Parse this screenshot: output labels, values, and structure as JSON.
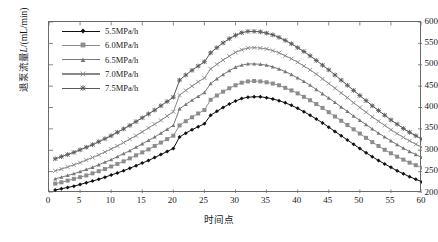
{
  "chart_data": {
    "type": "line",
    "title": "",
    "xlabel": "时间点",
    "ylabel_prefix": "退泵流量",
    "ylabel_italic": "L",
    "ylabel_suffix": "/(mL/min)",
    "ylabel_full": "退泵流量L/(mL/min)",
    "xlim": [
      0,
      60
    ],
    "ylim": [
      200,
      600
    ],
    "xticks": [
      0,
      5,
      10,
      15,
      20,
      25,
      30,
      35,
      40,
      45,
      50,
      55,
      60
    ],
    "yticks": [
      200,
      250,
      300,
      350,
      400,
      450,
      500,
      550,
      600
    ],
    "grid": false,
    "legend_position": "upper-left-inside",
    "x": [
      1,
      2,
      3,
      4,
      5,
      6,
      7,
      8,
      9,
      10,
      11,
      12,
      13,
      14,
      15,
      16,
      17,
      18,
      19,
      20,
      21,
      22,
      23,
      24,
      25,
      26,
      27,
      28,
      29,
      30,
      31,
      32,
      33,
      34,
      35,
      36,
      37,
      38,
      39,
      40,
      41,
      42,
      43,
      44,
      45,
      46,
      47,
      48,
      49,
      50,
      51,
      52,
      53,
      54,
      55,
      56,
      57,
      58,
      59,
      60
    ],
    "series": [
      {
        "name": "5.5MPa/h",
        "marker": "diamond",
        "color": "#111111",
        "values": [
          207,
          210,
          213,
          216,
          220,
          224,
          228,
          232,
          237,
          242,
          247,
          252,
          258,
          264,
          270,
          276,
          283,
          290,
          297,
          304,
          331,
          340,
          348,
          355,
          362,
          382,
          391,
          400,
          408,
          415,
          421,
          424,
          425,
          425,
          423,
          420,
          416,
          411,
          405,
          398,
          390,
          382,
          373,
          364,
          354,
          344,
          334,
          324,
          314,
          304,
          294,
          285,
          276,
          268,
          260,
          252,
          245,
          238,
          232,
          226
        ]
      },
      {
        "name": "6.0MPa/h",
        "marker": "square",
        "color": "#8c8c8c",
        "values": [
          222,
          225,
          229,
          233,
          237,
          241,
          246,
          251,
          256,
          262,
          268,
          274,
          281,
          288,
          295,
          302,
          310,
          318,
          326,
          334,
          358,
          368,
          377,
          386,
          394,
          418,
          428,
          437,
          445,
          452,
          458,
          461,
          462,
          461,
          459,
          456,
          452,
          446,
          440,
          433,
          425,
          417,
          408,
          399,
          389,
          379,
          369,
          359,
          349,
          339,
          329,
          319,
          310,
          301,
          293,
          285,
          278,
          271,
          265,
          259
        ]
      },
      {
        "name": "6.5MPa/h",
        "marker": "triangle",
        "color": "#777777",
        "values": [
          233,
          237,
          241,
          245,
          250,
          255,
          260,
          266,
          272,
          278,
          285,
          292,
          299,
          307,
          315,
          323,
          331,
          340,
          349,
          358,
          397,
          407,
          417,
          426,
          435,
          456,
          467,
          477,
          486,
          494,
          499,
          502,
          502,
          501,
          499,
          495,
          490,
          484,
          477,
          469,
          461,
          452,
          442,
          432,
          422,
          412,
          401,
          391,
          380,
          370,
          360,
          350,
          340,
          331,
          322,
          313,
          305,
          297,
          290,
          283
        ]
      },
      {
        "name": "7.0MPa/h",
        "marker": "x",
        "color": "#888888",
        "values": [
          252,
          256,
          261,
          266,
          271,
          277,
          283,
          289,
          296,
          303,
          310,
          318,
          326,
          334,
          343,
          352,
          361,
          370,
          380,
          390,
          429,
          440,
          450,
          460,
          469,
          490,
          501,
          511,
          520,
          529,
          535,
          539,
          540,
          539,
          537,
          533,
          528,
          521,
          514,
          506,
          497,
          488,
          478,
          467,
          456,
          445,
          434,
          423,
          411,
          400,
          389,
          378,
          368,
          358,
          348,
          339,
          330,
          322,
          314,
          307
        ]
      },
      {
        "name": "7.5MPa/h",
        "marker": "star",
        "color": "#5a5a5a",
        "values": [
          280,
          285,
          290,
          295,
          301,
          307,
          313,
          320,
          327,
          334,
          342,
          350,
          358,
          367,
          376,
          385,
          394,
          404,
          414,
          424,
          464,
          476,
          487,
          497,
          507,
          528,
          540,
          551,
          561,
          569,
          575,
          578,
          578,
          577,
          574,
          570,
          564,
          557,
          549,
          540,
          531,
          521,
          510,
          499,
          488,
          476,
          464,
          452,
          440,
          428,
          416,
          404,
          393,
          382,
          371,
          361,
          351,
          342,
          334,
          326
        ]
      }
    ]
  },
  "legend": {
    "items": [
      {
        "label": "5.5MPa/h"
      },
      {
        "label": "6.0MPa/h"
      },
      {
        "label": "6.5MPa/h"
      },
      {
        "label": "7.0MPa/h"
      },
      {
        "label": "7.5MPa/h"
      }
    ]
  }
}
